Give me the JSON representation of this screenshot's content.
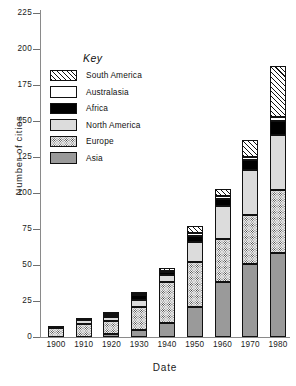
{
  "chart_data": {
    "type": "bar",
    "stacked": true,
    "title": "",
    "xlabel": "Date",
    "ylabel": "Number of cities",
    "categories": [
      "1900",
      "1910",
      "1920",
      "1930",
      "1940",
      "1950",
      "1960",
      "1970",
      "1980"
    ],
    "ylim": [
      0,
      225
    ],
    "yticks": [
      0,
      25,
      50,
      75,
      100,
      125,
      150,
      175,
      200,
      225
    ],
    "grid": false,
    "legend_title": "Key",
    "legend_position": "inside-upper-left",
    "series": [
      {
        "name": "Asia",
        "key": "asia",
        "fill": "solid-grey",
        "color": "#9a9a9a",
        "values": [
          0,
          0,
          2,
          5,
          10,
          21,
          38,
          51,
          58
        ]
      },
      {
        "name": "Europe",
        "key": "europe",
        "fill": "fine-dots",
        "color": "#f2f2f2",
        "values": [
          6,
          9,
          9,
          16,
          28,
          31,
          30,
          34,
          44
        ]
      },
      {
        "name": "North America",
        "key": "northamerica",
        "fill": "light-grey",
        "color": "#dcdcdc",
        "values": [
          1,
          3,
          3,
          5,
          5,
          14,
          23,
          31,
          38
        ]
      },
      {
        "name": "Africa",
        "key": "africa",
        "fill": "black",
        "color": "#000000",
        "values": [
          0,
          1,
          1,
          3,
          2,
          4,
          5,
          7,
          10
        ]
      },
      {
        "name": "Australasia",
        "key": "australasia",
        "fill": "white",
        "color": "#ffffff",
        "values": [
          0,
          0,
          1,
          1,
          1,
          2,
          2,
          2,
          3
        ]
      },
      {
        "name": "South America",
        "key": "southamerica",
        "fill": "diagonal-hatch",
        "color": "#ffffff",
        "values": [
          0,
          0,
          1,
          1,
          2,
          5,
          5,
          12,
          35
        ]
      }
    ],
    "totals": [
      7,
      13,
      17,
      31,
      48,
      77,
      103,
      137,
      188
    ]
  },
  "axes": {
    "ylabel": "Number of cities",
    "xlabel": "Date",
    "ytick_labels": [
      "0",
      "25",
      "50",
      "75",
      "100",
      "125",
      "150",
      "175",
      "200",
      "225"
    ],
    "xtick_labels": [
      "1900",
      "1910",
      "1920",
      "1930",
      "1940",
      "1950",
      "1960",
      "1970",
      "1980"
    ]
  },
  "legend": {
    "title": "Key",
    "items": [
      {
        "label": "South America"
      },
      {
        "label": "Australasia"
      },
      {
        "label": "Africa"
      },
      {
        "label": "North America"
      },
      {
        "label": "Europe"
      },
      {
        "label": "Asia"
      }
    ]
  }
}
